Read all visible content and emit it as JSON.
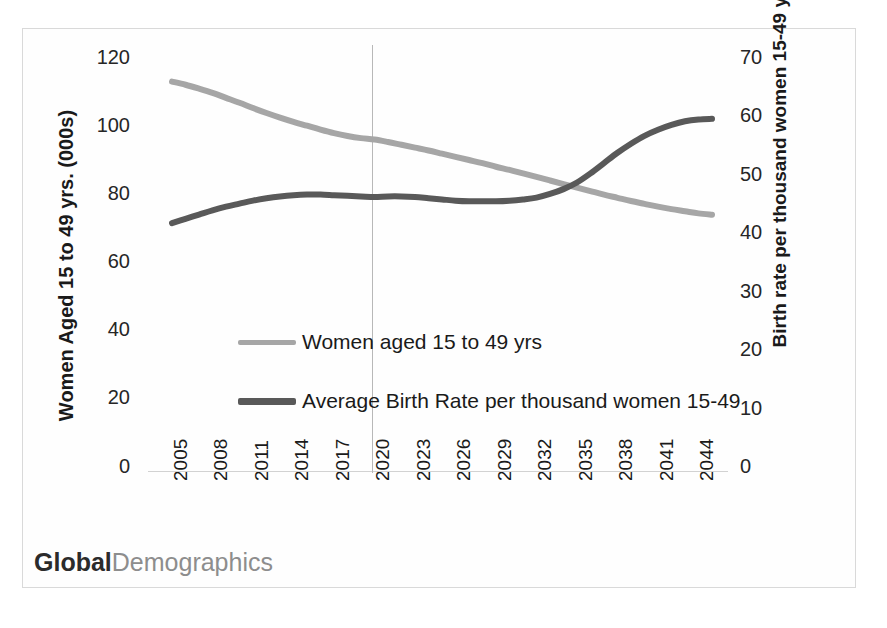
{
  "chart_data": {
    "type": "line",
    "title": "",
    "xlabel": "",
    "ylabel": "Women Aged 15 to 49 yrs. (000s)",
    "y2label": "Birth rate per thousand women 15-49 yrs.",
    "grid": false,
    "legend_position": "inside-center-left",
    "x": [
      2005,
      2006,
      2007,
      2008,
      2009,
      2010,
      2011,
      2012,
      2013,
      2014,
      2015,
      2016,
      2017,
      2018,
      2019,
      2020,
      2021,
      2022,
      2023,
      2024,
      2025,
      2026,
      2027,
      2028,
      2029,
      2030,
      2031,
      2032,
      2033,
      2034,
      2035,
      2036,
      2037,
      2038,
      2039,
      2040,
      2041,
      2042,
      2043,
      2044,
      2045
    ],
    "xtick_labels": [
      "2005",
      "2008",
      "2011",
      "2014",
      "2017",
      "2020",
      "2023",
      "2026",
      "2029",
      "2032",
      "2035",
      "2038",
      "2041",
      "2044"
    ],
    "ytick_labels": [
      "120",
      "100",
      "80",
      "60",
      "40",
      "20",
      "0"
    ],
    "y2tick_labels": [
      "70",
      "60",
      "50",
      "40",
      "30",
      "20",
      "10",
      "0"
    ],
    "ylim": [
      0,
      120
    ],
    "y2lim": [
      0,
      70
    ],
    "xlim": [
      2005,
      2045
    ],
    "annotations": [
      {
        "name": "vertical-marker",
        "x": 2020,
        "label": ""
      }
    ],
    "series": [
      {
        "name": "Women aged 15 to 49 yrs",
        "axis": "left",
        "color": "#a6a6a6",
        "unit": "000s",
        "values": [
          110.5,
          109.6,
          108.5,
          107.3,
          105.9,
          104.5,
          103.0,
          101.6,
          100.3,
          99.1,
          98.0,
          96.9,
          95.9,
          95.1,
          94.5,
          94.1,
          93.4,
          92.6,
          91.8,
          91.0,
          90.1,
          89.2,
          88.3,
          87.4,
          86.4,
          85.5,
          84.5,
          83.5,
          82.5,
          81.5,
          80.5,
          79.5,
          78.5,
          77.6,
          76.7,
          75.9,
          75.1,
          74.4,
          73.8,
          73.2,
          72.8
        ]
      },
      {
        "name": "Average Birth Rate per thousand women 15-49",
        "axis": "right",
        "color": "#595959",
        "unit": "per thousand",
        "values": [
          41.1,
          41.8,
          42.5,
          43.2,
          43.8,
          44.3,
          44.8,
          45.2,
          45.5,
          45.7,
          45.8,
          45.8,
          45.7,
          45.6,
          45.5,
          45.4,
          45.5,
          45.5,
          45.4,
          45.2,
          45.0,
          44.8,
          44.7,
          44.7,
          44.7,
          44.8,
          45.0,
          45.3,
          45.9,
          46.7,
          47.8,
          49.3,
          51.0,
          52.7,
          54.2,
          55.5,
          56.5,
          57.3,
          57.9,
          58.2,
          58.3
        ]
      }
    ]
  },
  "legend": {
    "items": [
      {
        "label": "Women aged 15 to 49 yrs",
        "color": "#a6a6a6"
      },
      {
        "label": "Average Birth Rate per thousand women 15-49",
        "color": "#595959"
      }
    ]
  },
  "watermark": {
    "bold_text": "Global",
    "light_text": "Demographics"
  },
  "colors": {
    "series_light": "#a6a6a6",
    "series_dark": "#595959",
    "frame": "#d9d9d9",
    "baseline": "#d2d2d2",
    "marker_line": "#b8b8b8",
    "text": "#1a1a1a"
  }
}
